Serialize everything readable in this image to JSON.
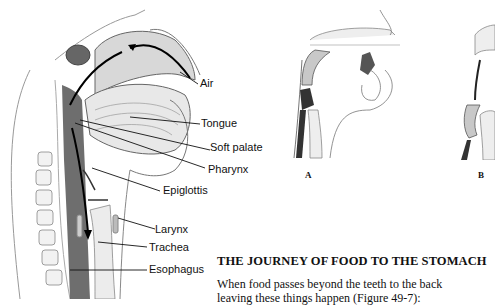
{
  "main_figure": {
    "labels": {
      "air": "Air",
      "tongue": "Tongue",
      "soft_palate": "Soft palate",
      "pharynx": "Pharynx",
      "epiglottis": "Epiglottis",
      "larynx": "Larynx",
      "trachea": "Trachea",
      "esophagus": "Esophagus"
    }
  },
  "sub_figures": [
    {
      "letter": "A"
    },
    {
      "letter": "B"
    }
  ],
  "section": {
    "heading": "THE JOURNEY OF FOOD TO THE STOMACH",
    "paragraph_line_1": "When food passes beyond the teeth to the back",
    "paragraph_line_2": "leaving these things happen (Figure 49-7):"
  }
}
